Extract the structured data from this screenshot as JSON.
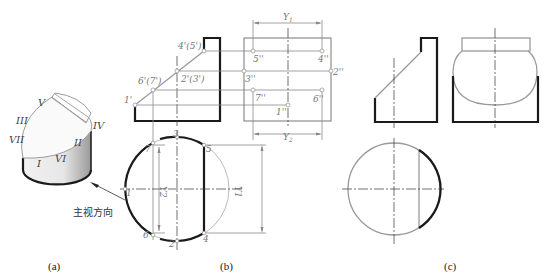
{
  "figure": {
    "captions": {
      "a": "(a)",
      "b": "(b)",
      "c": "(c)"
    },
    "isometric": {
      "face_labels": [
        "V",
        "III",
        "IV",
        "VII",
        "II",
        "VI",
        "I"
      ],
      "view_direction_label": "主视方向"
    },
    "front_view_points": [
      "4'(5')",
      "2'(3')",
      "6'(7')",
      "1'"
    ],
    "side_view_points": [
      "5''",
      "4''",
      "3''",
      "2''",
      "7''",
      "6''",
      "1''"
    ],
    "top_view_points": [
      "3",
      "7",
      "5",
      "1",
      "6",
      "2",
      "4"
    ],
    "dimensions": {
      "y1": "Y",
      "y1_sub": "1",
      "y2": "Y",
      "y2_sub": "2"
    },
    "colors": {
      "visible_line": "#1a1a1a",
      "construction_line": "#9a9a9a"
    }
  }
}
